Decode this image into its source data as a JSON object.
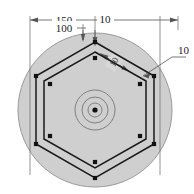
{
  "drawing": {
    "title": "Hexagonal bolt-circle plate - top view",
    "background_color": "#ffffff",
    "plate_fill_color": "#cfcfcf",
    "plate_stroke_color": "#9a9a9a",
    "line_color": "#1a1a1a",
    "dimension_line_color": "#555555",
    "marker_color": "#111111"
  },
  "dimensions": {
    "overall_width": "150",
    "inner_width": "100",
    "edge_offset": "10",
    "hex_side_offset": "10",
    "leader_callout": "10"
  },
  "geometry": {
    "plate": {
      "cx": 95,
      "cy": 110,
      "r": 77
    },
    "center_marks": [
      {
        "r": 20
      },
      {
        "r": 13
      },
      {
        "r": 7
      }
    ],
    "center_dot_r": 2.6,
    "outer_hex_r": 68,
    "inner_hex_r": 60,
    "outer_markers_r": 68,
    "inner_markers_r": 52,
    "marker_size": 4.2
  },
  "notes": {
    "hex_count": "6",
    "marker_count_outer": "6",
    "marker_count_inner": "6"
  }
}
